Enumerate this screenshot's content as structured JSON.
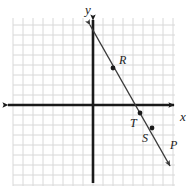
{
  "figure": {
    "type": "coordinate-plane-diagram",
    "width": 195,
    "height": 189,
    "background_color": "#ffffff"
  },
  "grid": {
    "color": "#d8d8d8",
    "cell_size": 10,
    "x_start": 13,
    "x_end": 175,
    "y_start": 18,
    "y_end": 186,
    "visible": true
  },
  "axes": {
    "color": "#1a1a1a",
    "origin_x": 93,
    "origin_y": 105,
    "x_axis": {
      "label": "x",
      "label_x": 180,
      "label_y": 110,
      "left_end": 8,
      "right_end": 174,
      "arrow_left": true,
      "arrow_right": true
    },
    "y_axis": {
      "label": "y",
      "label_x": 85,
      "label_y": 3,
      "top_end": 20,
      "bottom_end": 183,
      "arrow_top": true,
      "arrow_bottom": false
    }
  },
  "line": {
    "color": "#3a3a3a",
    "x1": 90,
    "y1": 25,
    "x2": 170,
    "y2": 166,
    "arrow_start": true,
    "arrow_end": true
  },
  "points": [
    {
      "name": "R",
      "dot_x": 113,
      "dot_y": 68,
      "label_x": 119,
      "label_y": 54
    },
    {
      "name": "T",
      "dot_x": 140,
      "dot_y": 113,
      "label_x": 130,
      "label_y": 117
    },
    {
      "name": "S",
      "dot_x": 152,
      "dot_y": 128,
      "label_x": 142,
      "label_y": 132
    },
    {
      "name": "P",
      "dot_x": null,
      "dot_y": null,
      "label_x": 170,
      "label_y": 139
    }
  ],
  "point_style": {
    "color": "#1a1a1a",
    "radius": 2.4
  }
}
